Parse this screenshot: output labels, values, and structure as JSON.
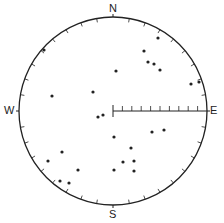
{
  "diagram": {
    "type": "stereonet",
    "labels": {
      "north": "N",
      "east": "E",
      "south": "S",
      "west": "W"
    },
    "center": [
      113,
      111
    ],
    "radius": 94,
    "ink_color": "#222222",
    "scale_bar": {
      "from": "center",
      "to": "east",
      "tick_count": 9
    },
    "rim_tick_step_deg": 10
  },
  "chart_data": {
    "type": "scatter",
    "title": "",
    "points_px": [
      [
        44,
        50
      ],
      [
        52,
        96
      ],
      [
        93,
        92
      ],
      [
        98,
        117
      ],
      [
        103,
        115
      ],
      [
        114,
        137
      ],
      [
        116,
        71
      ],
      [
        158,
        38
      ],
      [
        144,
        51
      ],
      [
        148,
        62
      ],
      [
        154,
        64
      ],
      [
        160,
        70
      ],
      [
        191,
        84
      ],
      [
        199,
        82
      ],
      [
        152,
        132
      ],
      [
        164,
        130
      ],
      [
        131,
        148
      ],
      [
        123,
        162
      ],
      [
        134,
        161
      ],
      [
        134,
        171
      ],
      [
        114,
        170
      ],
      [
        62,
        152
      ],
      [
        48,
        161
      ],
      [
        78,
        170
      ],
      [
        60,
        181
      ],
      [
        69,
        183
      ]
    ]
  }
}
